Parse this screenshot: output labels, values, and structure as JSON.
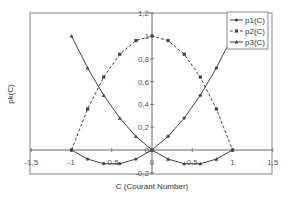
{
  "chart_data": {
    "type": "line",
    "title": "",
    "xlabel": "C (Courant Number)",
    "ylabel": "pk(C)",
    "xlim": [
      -1.5,
      1.5
    ],
    "ylim": [
      -0.2,
      1.2
    ],
    "x_ticks": [
      "-1,5",
      "-1",
      "-0,5",
      "0",
      "0,5",
      "1",
      "1,5"
    ],
    "y_ticks": [
      "-0,2",
      "0",
      "0,2",
      "0,4",
      "0,6",
      "0,8",
      "1",
      "1,2"
    ],
    "grid": false,
    "legend_position": "top-right",
    "x": [
      -1.0,
      -0.8,
      -0.6,
      -0.4,
      -0.2,
      0.0,
      0.2,
      0.4,
      0.6,
      0.8,
      1.0
    ],
    "series": [
      {
        "name": "p1(C)",
        "style": "solid",
        "marker": "circle",
        "values": [
          0.0,
          -0.08,
          -0.12,
          -0.12,
          -0.08,
          0.0,
          0.12,
          0.28,
          0.48,
          0.72,
          1.0
        ]
      },
      {
        "name": "p2(C)",
        "style": "dashed",
        "marker": "square",
        "values": [
          0.0,
          0.36,
          0.64,
          0.84,
          0.96,
          1.0,
          0.96,
          0.84,
          0.64,
          0.36,
          0.0
        ]
      },
      {
        "name": "p3(C)",
        "style": "solid",
        "marker": "triangle",
        "values": [
          1.0,
          0.72,
          0.48,
          0.28,
          0.12,
          0.0,
          -0.08,
          -0.12,
          -0.12,
          -0.08,
          0.0
        ]
      }
    ]
  },
  "colors": {
    "line": "#444444",
    "frame": "#888888",
    "axis": "#666666"
  },
  "labels": {
    "xlabel": "C (Courant Number)",
    "ylabel": "pk(C)",
    "legend": [
      "p1(C)",
      "p2(C)",
      "p3(C)"
    ]
  }
}
